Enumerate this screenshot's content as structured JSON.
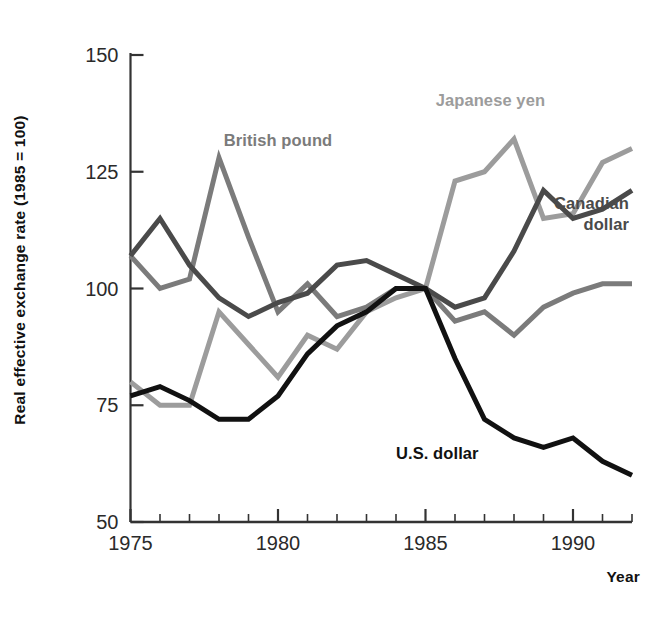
{
  "chart_data": {
    "type": "line",
    "title": "",
    "xlabel": "Year",
    "ylabel": "Real effective exchange rate (1985 = 100)",
    "xlim": [
      1975,
      1992
    ],
    "ylim": [
      50,
      150
    ],
    "yticks": [
      50,
      75,
      100,
      125,
      150
    ],
    "ytick_labels": [
      "50",
      "75",
      "100",
      "125",
      "150"
    ],
    "xticks": [
      1975,
      1980,
      1985,
      1990
    ],
    "xtick_labels": [
      "1975",
      "1980",
      "1985",
      "1990"
    ],
    "x_minor_tick_interval": 1,
    "grid": false,
    "legend": "inline-annotations",
    "x": [
      1975,
      1976,
      1977,
      1978,
      1979,
      1980,
      1981,
      1982,
      1983,
      1984,
      1985,
      1986,
      1987,
      1988,
      1989,
      1990,
      1991,
      1992
    ],
    "series": [
      {
        "name": "British pound",
        "color": "#7b7b7b",
        "label_x": 1980.0,
        "label_y": 130.5,
        "label_anchor": "middle",
        "values": [
          107,
          100,
          102,
          128,
          111,
          95,
          101,
          94,
          96,
          100,
          100,
          93,
          95,
          90,
          96,
          99,
          101,
          101
        ]
      },
      {
        "name": "Japanese yen",
        "color": "#9c9c9c",
        "label_x": 1987.2,
        "label_y": 139.0,
        "label_anchor": "middle",
        "values": [
          80,
          75,
          75,
          95,
          88,
          81,
          90,
          87,
          95,
          98,
          100,
          123,
          125,
          132,
          115,
          116,
          127,
          130
        ]
      },
      {
        "name": "Canadian dollar",
        "color": "#4a4a4a",
        "label_x": 1991.9,
        "label_y": 117.0,
        "label_anchor": "end",
        "label_lines": [
          "Canadian",
          "dollar"
        ],
        "values": [
          107,
          115,
          105,
          98,
          94,
          97,
          99,
          105,
          106,
          103,
          100,
          96,
          98,
          108,
          121,
          115,
          117,
          121
        ]
      },
      {
        "name": "U.S. dollar",
        "color": "#111111",
        "label_x": 1985.4,
        "label_y": 63.5,
        "label_anchor": "middle",
        "values": [
          77,
          79,
          76,
          72,
          72,
          77,
          86,
          92,
          95,
          100,
          100,
          85,
          72,
          68,
          66,
          68,
          63,
          60
        ]
      }
    ],
    "axis_color": "#333333",
    "line_width": 5
  }
}
